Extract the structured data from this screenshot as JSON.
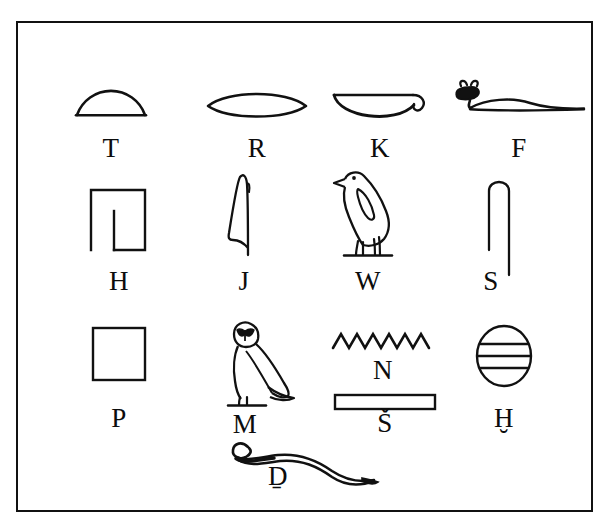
{
  "figure": {
    "background_color": "#ffffff",
    "ink_color": "#111111",
    "border_color": "#111111"
  },
  "glyphs": [
    {
      "id": "t",
      "label": "T",
      "icon_name": "bread-loaf-semicircle-glyph",
      "description": "semicircle bread loaf",
      "row": 1,
      "column": 1
    },
    {
      "id": "r",
      "label": "R",
      "icon_name": "mouth-lens-glyph",
      "description": "horizontal lens / mouth",
      "row": 1,
      "column": 2
    },
    {
      "id": "k",
      "label": "K",
      "icon_name": "basket-with-handle-glyph",
      "description": "basket with handle loop at right",
      "row": 1,
      "column": 3
    },
    {
      "id": "f",
      "label": "F",
      "icon_name": "horned-viper-glyph",
      "description": "horned viper with raised head at left",
      "row": 1,
      "column": 4
    },
    {
      "id": "h",
      "label": "H",
      "icon_name": "courtyard-plan-glyph",
      "description": "rectangular courtyard plan with inner wall",
      "row": 2,
      "column": 1
    },
    {
      "id": "j",
      "label": "J",
      "icon_name": "reed-leaf-glyph",
      "description": "tall narrow flowering reed",
      "row": 2,
      "column": 2
    },
    {
      "id": "w",
      "label": "W",
      "icon_name": "quail-chick-glyph",
      "description": "quail chick standing on ground line",
      "row": 2,
      "column": 3
    },
    {
      "id": "s",
      "label": "S",
      "icon_name": "folded-cloth-glyph",
      "description": "folded cloth, inverted U with two legs",
      "row": 2,
      "column": 4
    },
    {
      "id": "p",
      "label": "P",
      "icon_name": "stool-square-glyph",
      "description": "plain square stool / mat",
      "row": 3,
      "column": 1
    },
    {
      "id": "m",
      "label": "M",
      "icon_name": "owl-glyph",
      "description": "owl with frontal face, body in profile",
      "row": 3,
      "column": 2
    },
    {
      "id": "n",
      "label": "N",
      "icon_name": "water-ripple-zigzag-glyph",
      "description": "zigzag water ripple with six peaks",
      "row": 3,
      "column": 3
    },
    {
      "id": "sh",
      "label": "Š",
      "icon_name": "pool-rectangle-glyph",
      "description": "long horizontal rectangle, pool of water",
      "row": 3,
      "column": 3
    },
    {
      "id": "hh",
      "label": "Ḫ",
      "icon_name": "wick-striped-circle-glyph",
      "description": "oval with three horizontal lines, wick of twisted flax",
      "row": 3,
      "column": 4
    },
    {
      "id": "dj",
      "label": "Ḏ",
      "icon_name": "cobra-snake-glyph",
      "description": "cobra with coiled head at left and wavy body",
      "row": 4,
      "column": 2
    }
  ]
}
